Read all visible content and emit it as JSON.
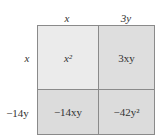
{
  "column_headers": [
    "x",
    "3y"
  ],
  "row_headers": [
    "x",
    "−14y"
  ],
  "cells": [
    [
      "x²",
      "3xy"
    ],
    [
      "−14xy",
      "−42y²"
    ]
  ],
  "colors": {
    "border": "#8a8a8a",
    "cell_top_left": "#ebebeb",
    "cell_other": "#dcdcdc"
  }
}
